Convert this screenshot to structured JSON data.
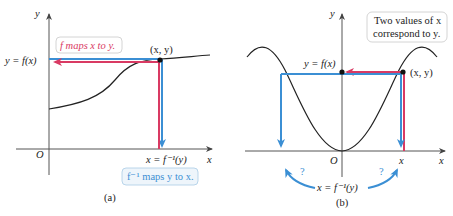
{
  "panel_a": {
    "caption": "(a)",
    "y_axis_label": "y",
    "x_axis_label": "x",
    "origin_label": "O",
    "y_value_label": "y = f(x)",
    "x_value_label": "x = f⁻¹(y)",
    "point_label": "(x, y)",
    "callout_forward": "f maps x to y.",
    "callout_inverse": "f⁻¹ maps y to x."
  },
  "panel_b": {
    "caption": "(b)",
    "y_axis_label": "y",
    "x_axis_label": "x",
    "origin_label": "O",
    "y_value_label": "y = f(x)",
    "x_tick_label": "x",
    "point_label": "(x, y)",
    "inverse_label": "x = f⁻¹(y)",
    "question_left": "?",
    "question_right": "?",
    "callout": [
      "Two values of x",
      "correspond to y."
    ]
  },
  "colors": {
    "forward_arrow": "#d93a63",
    "inverse_arrow": "#3b8fd4",
    "curve": "#222222",
    "axis": "#555555"
  }
}
